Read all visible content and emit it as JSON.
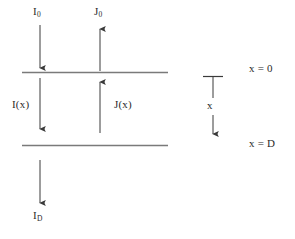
{
  "figure": {
    "colors": {
      "background": "#ffffff",
      "boundary_line": "#7a7a7a",
      "arrow": "#3a3a3a",
      "text": "#2b2b2b"
    },
    "labels": {
      "incident_flux_top": "I",
      "incident_flux_top_sub": "0",
      "emergent_flux_top": "J",
      "emergent_flux_top_sub": "0",
      "internal_downward_flux": "I(x)",
      "internal_upward_flux": "J(x)",
      "transmitted_flux_bottom": "I",
      "transmitted_flux_bottom_sub": "D",
      "depth_axis": "x",
      "top_boundary": "x = 0",
      "bottom_boundary": "x = D"
    },
    "geometry": {
      "boundary_top_y": 72,
      "boundary_bottom_y": 145,
      "boundary_x_start": 22,
      "boundary_x_end": 168,
      "slab_thickness_label": "D"
    },
    "arrows": [
      {
        "name": "I0",
        "direction": "down",
        "x": 40,
        "y_start": 25,
        "y_end": 69
      },
      {
        "name": "J0",
        "direction": "up",
        "x": 100,
        "y_start": 70,
        "y_end": 27
      },
      {
        "name": "I(x)",
        "direction": "down",
        "x": 40,
        "y_start": 78,
        "y_end": 130
      },
      {
        "name": "J(x)",
        "direction": "up",
        "x": 100,
        "y_start": 133,
        "y_end": 80
      },
      {
        "name": "ID",
        "direction": "down",
        "x": 40,
        "y_start": 160,
        "y_end": 204
      },
      {
        "name": "x-axis",
        "direction": "down",
        "x": 213,
        "y_start": 77,
        "y_end": 135
      }
    ]
  }
}
